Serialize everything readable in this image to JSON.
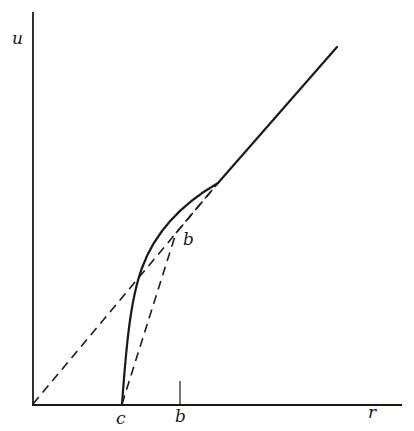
{
  "figure": {
    "type": "diagram",
    "colors": {
      "ink": "#1a1a1a",
      "background": "#ffffff"
    },
    "axes": {
      "y_label": "u",
      "x_label": "r",
      "x_ticks": [
        {
          "label": "c",
          "position": "c"
        },
        {
          "label": "b",
          "position": "b"
        }
      ]
    },
    "curves": [
      {
        "name": "solid-curve",
        "style": "solid",
        "description": "Starts at r=c on axis, rises steeply, bends over to meet tangent line, then continues linearly"
      },
      {
        "name": "tangent-line",
        "style": "dashed",
        "description": "From origin tangent to the solid curve"
      },
      {
        "name": "chord-c-to-b",
        "style": "dashed",
        "description": "From point c on r-axis to point b"
      },
      {
        "name": "chord-b-to-tangency",
        "style": "dashed",
        "description": "From point b to the tangency point"
      }
    ],
    "point_labels": [
      {
        "label": "b",
        "description": "Point b on dashed chord"
      }
    ]
  }
}
